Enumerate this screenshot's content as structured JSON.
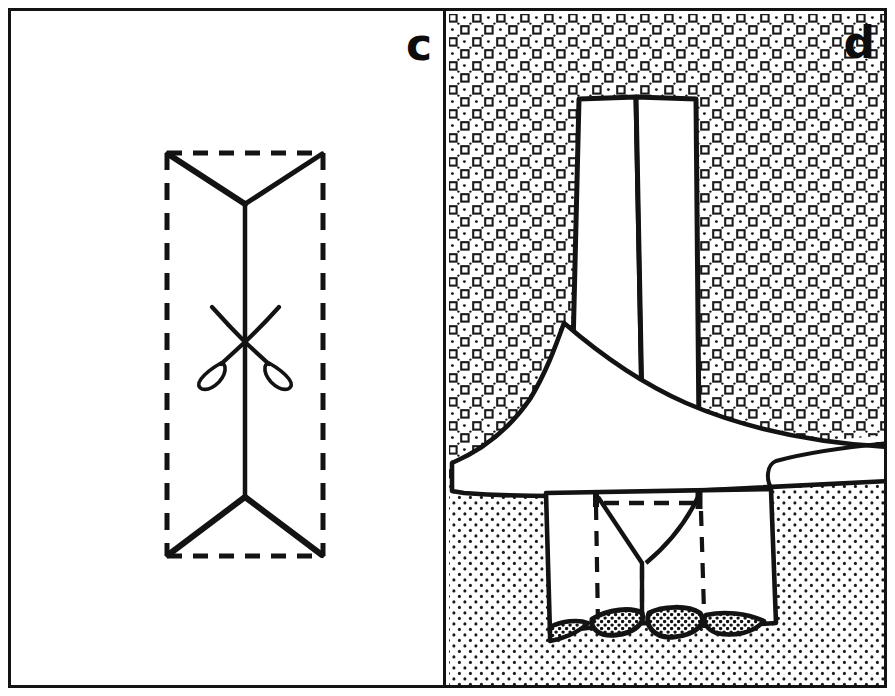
{
  "figure": {
    "width": 895,
    "height": 696,
    "background": "#ffffff",
    "ink_color": "#131313",
    "type": "two-panel-line-diagram"
  },
  "panels": [
    {
      "id": "c",
      "label": "c",
      "label_position": "top-right",
      "background": "#ffffff",
      "description": "Outlined white rectangle panel containing a dashed rectangle with solid Y-shaped converging lines at top and bottom and a scissors symbol on the central vertical axis",
      "elements": {
        "dashed_rectangle": {
          "name": "dashed-outline-rectangle",
          "x": 162,
          "y": 148,
          "width": 158,
          "height": 407,
          "stroke": "#131313",
          "stroke_width": 4,
          "dash": "14 11"
        },
        "top_wedge": {
          "name": "top-converging-wedge",
          "left_corner": [
            164,
            150
          ],
          "right_corner": [
            318,
            150
          ],
          "vertex": [
            241,
            200
          ]
        },
        "bottom_wedge": {
          "name": "bottom-converging-wedge",
          "left_corner": [
            164,
            553
          ],
          "right_corner": [
            318,
            553
          ],
          "vertex": [
            241,
            493
          ]
        },
        "center_axis": {
          "name": "vertical-center-line",
          "x": 241,
          "y_top": 200,
          "y_bottom": 493
        },
        "scissors": {
          "name": "scissors-symbol",
          "center_x": 241,
          "center_y": 330,
          "blade_tip_left": [
            208,
            303
          ],
          "blade_tip_right": [
            274,
            303
          ],
          "handle_left": [
            212,
            362
          ],
          "handle_right": [
            270,
            362
          ]
        }
      }
    },
    {
      "id": "d",
      "label": "d",
      "label_position": "top-right",
      "background": "patterned",
      "description": "Outlined panel showing an upper conglomerate unit with square-and-dot ornament, a lower sandstone unit with fine dot stipple, a vertical white two-part column, a broad white flap/wedge, and a lower white flap with dashed seams and dark stippled pebble lenses",
      "elements": {
        "upper_unit": {
          "name": "conglomerate-unit",
          "pattern": "square-ring-and-dot-grid",
          "extent": "top of panel down to irregular contact at about y=435"
        },
        "lower_unit": {
          "name": "sandstone-unit",
          "pattern": "fine-dot-stipple",
          "extent": "below irregular contact to base of panel"
        },
        "vertical_column": {
          "name": "vertical-white-column",
          "x_left": 573,
          "x_right": 690,
          "y_top": 94,
          "split_line_x": 634,
          "description": "two adjacent white panels split by a central vertical line"
        },
        "flap_upper": {
          "name": "upper-white-flap",
          "description": "broad curved white wedge sweeping from apex near x=560,y=315 down-right across the panel to the right edge"
        },
        "flap_lower": {
          "name": "lower-white-flap",
          "description": "rectangular white flap with dashed vertical seams, a dashed horizontal seam, and a central V notch",
          "x_left": 543,
          "x_right": 752,
          "y_top": 490,
          "y_bottom": 630
        },
        "pebble_lenses": {
          "name": "pebble-lens-group",
          "fill": "coarse-stipple",
          "count": 4,
          "description": "dark-outlined elongated lenses with coarse stipple fill at the base of the lower flap"
        },
        "dashed_seams": {
          "name": "dashed-seam-lines",
          "stroke": "#131313",
          "dash": "11 8"
        }
      }
    }
  ],
  "colors": {
    "ink": "#131313",
    "paper": "#ffffff",
    "pattern_dot": "#1a1a1a"
  }
}
